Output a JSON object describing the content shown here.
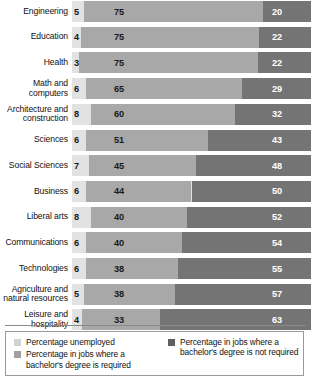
{
  "chart_data": {
    "type": "bar",
    "subtype": "stacked-horizontal-100pct",
    "title": "",
    "xlabel": "",
    "ylabel": "",
    "xlim": [
      0,
      100
    ],
    "grid": false,
    "legend_position": "bottom",
    "categories": [
      "Engineering",
      "Education",
      "Health",
      "Math and\ncomputers",
      "Architecture and\nconstruction",
      "Sciences",
      "Social Sciences",
      "Business",
      "Liberal arts",
      "Communications",
      "Technologies",
      "Agriculture and\nnatural resources",
      "Leisure and\nhospitality"
    ],
    "series": [
      {
        "name": "Percentage unemployed",
        "color": "#e2e2e2",
        "values": [
          5,
          4,
          3,
          6,
          8,
          6,
          7,
          6,
          8,
          6,
          6,
          5,
          4
        ]
      },
      {
        "name": "Percentage in jobs where a bachelor's degree is required",
        "color": "#a8a8a8",
        "values": [
          75,
          75,
          75,
          65,
          60,
          51,
          45,
          44,
          40,
          40,
          38,
          38,
          33
        ]
      },
      {
        "name": "Percentage in jobs where a bachelor's degree is not required",
        "color": "#747474",
        "values": [
          20,
          22,
          22,
          29,
          32,
          43,
          48,
          50,
          52,
          54,
          55,
          57,
          63
        ]
      }
    ]
  },
  "legend": {
    "items": [
      {
        "label": "Percentage unemployed",
        "swatch": "sw-unemployed"
      },
      {
        "label": "Percentage in jobs where a bachelor's degree is required",
        "swatch": "sw-required"
      },
      {
        "label": "Percentage in jobs where a bachelor's degree is not required",
        "swatch": "sw-notreq"
      }
    ]
  }
}
